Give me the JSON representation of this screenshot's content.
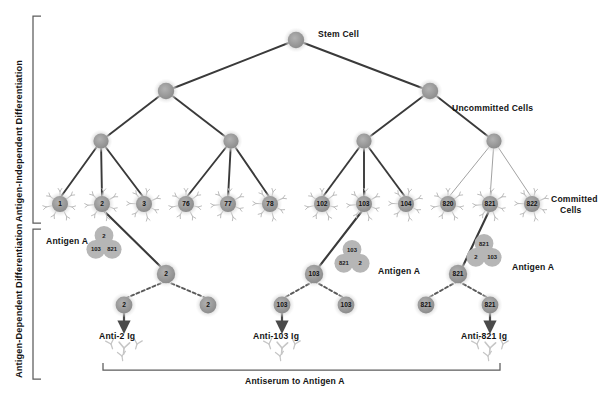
{
  "figure": {
    "background": "#ffffff",
    "palette": {
      "cell_fill": "#9d9d9d",
      "cell_halo": "#cfcfcf",
      "receptor": "#b8b8b8",
      "link_dark": "#3a3a3a",
      "link_light": "#9a9a9a",
      "antigen_fill": "#b5b5b5",
      "text": "#141414",
      "bracket": "#555555",
      "arrow": "#555555",
      "free_antibody": "#c3c3c3"
    }
  },
  "side_labels": {
    "independent": "Antigen-Independent Differentiation",
    "dependent": "Antigen-Dependent Differentiation"
  },
  "annotations": {
    "stem_cell": "Stem Cell",
    "uncommitted_cells": "Uncommitted Cells",
    "committed_cells_line1": "Committed",
    "committed_cells_line2": "Cells",
    "antigen_a_left": "Antigen A",
    "antigen_a_mid": "Antigen A",
    "antigen_a_right": "Antigen A",
    "antiserum": "Antiserum to Antigen A"
  },
  "chart_data": {
    "type": "diagram",
    "tiers": [
      {
        "name": "stem",
        "label": "Stem Cell",
        "count": 1,
        "nodes": [
          "stem"
        ]
      },
      {
        "name": "tier2",
        "count": 2,
        "nodes": [
          "t2a",
          "t2b"
        ]
      },
      {
        "name": "tier3",
        "count": 4,
        "nodes": [
          "t3a",
          "t3b",
          "t3c",
          "t3d"
        ]
      },
      {
        "name": "committed",
        "label": "Committed Cells",
        "count": 12,
        "nodes": [
          "1",
          "2",
          "3",
          "76",
          "77",
          "78",
          "102",
          "103",
          "104",
          "820",
          "821",
          "822"
        ]
      }
    ],
    "committed_cell_labels": [
      "1",
      "2",
      "3",
      "76",
      "77",
      "78",
      "102",
      "103",
      "104",
      "820",
      "821",
      "822"
    ],
    "activated_clones": [
      {
        "parent": "2",
        "antigen_cluster": {
          "top": "2",
          "left": "103",
          "right": "821"
        },
        "blast": "2",
        "daughters": [
          "2",
          "2"
        ],
        "secretes": "Anti-2 Ig",
        "arrow_from": "left"
      },
      {
        "parent": "103",
        "antigen_cluster": {
          "top": "103",
          "left": "821",
          "right": "2"
        },
        "blast": "103",
        "daughters": [
          "103",
          "103"
        ],
        "secretes": "Anti-103 Ig",
        "arrow_from": "left"
      },
      {
        "parent": "821",
        "antigen_cluster": {
          "top": "821",
          "left": "2",
          "right": "103"
        },
        "blast": "821",
        "daughters": [
          "821",
          "821"
        ],
        "secretes": "Anti-821 Ig",
        "arrow_from": "right"
      }
    ],
    "products": [
      "Anti-2 Ig",
      "Anti-103 Ig",
      "Anti-821 Ig"
    ],
    "bottom_bracket_label": "Antiserum to Antigen A"
  },
  "products": {
    "anti2": "Anti-2 Ig",
    "anti103": "Anti-103 Ig",
    "anti821": "Anti-821 Ig"
  },
  "committed": [
    {
      "id": "1",
      "x": 60
    },
    {
      "id": "2",
      "x": 102
    },
    {
      "id": "3",
      "x": 144
    },
    {
      "id": "76",
      "x": 186
    },
    {
      "id": "77",
      "x": 228
    },
    {
      "id": "78",
      "x": 270
    },
    {
      "id": "102",
      "x": 322
    },
    {
      "id": "103",
      "x": 364
    },
    {
      "id": "104",
      "x": 406
    },
    {
      "id": "820",
      "x": 448
    },
    {
      "id": "821",
      "x": 490
    },
    {
      "id": "822",
      "x": 532
    }
  ]
}
